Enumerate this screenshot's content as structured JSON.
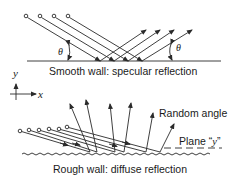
{
  "diagram": {
    "colors": {
      "line": "#2a2a2a",
      "background": "#ffffff",
      "text": "#1a1a1a"
    },
    "top_panel": {
      "caption": "Smooth wall: specular reflection",
      "angle_label_left": "θ",
      "angle_label_right": "θ",
      "ray_count": 4
    },
    "axes": {
      "y_label": "y",
      "x_label": "x"
    },
    "bottom_panel": {
      "caption": "Rough wall: diffuse reflection",
      "random_angle_label": "Random angle",
      "plane_label_prefix": "Plane “",
      "plane_label_var": "y",
      "plane_label_suffix": "”",
      "ray_count": 6
    }
  }
}
